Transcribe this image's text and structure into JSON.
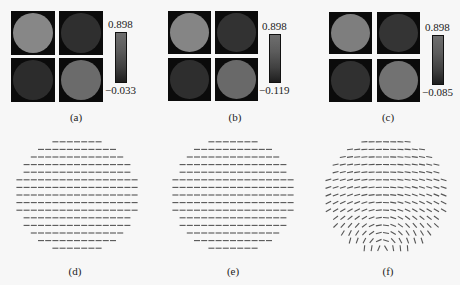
{
  "figure": {
    "panels_top": [
      {
        "id": "a",
        "caption": "(a)",
        "caption_pos": [
          76,
          111
        ],
        "colorbar": {
          "max_label": "0.898",
          "min_label": "−0.033",
          "x": 115,
          "y": 32,
          "h": 51
        },
        "squares": [
          {
            "x": 11,
            "y": 11,
            "w": 44,
            "h": 44,
            "fill": "#878787"
          },
          {
            "x": 59,
            "y": 11,
            "w": 44,
            "h": 44,
            "fill": "#2f2f2f"
          },
          {
            "x": 11,
            "y": 58,
            "w": 44,
            "h": 44,
            "fill": "#2c2c2c"
          },
          {
            "x": 59,
            "y": 58,
            "w": 44,
            "h": 44,
            "fill": "#6b6b6b"
          }
        ]
      },
      {
        "id": "b",
        "caption": "(b)",
        "caption_pos": [
          235,
          111
        ],
        "colorbar": {
          "max_label": "0.898",
          "min_label": "−0.119",
          "x": 269,
          "y": 34,
          "h": 49
        },
        "squares": [
          {
            "x": 168,
            "y": 11,
            "w": 43,
            "h": 43,
            "fill": "#858585"
          },
          {
            "x": 215,
            "y": 11,
            "w": 43,
            "h": 43,
            "fill": "#323232"
          },
          {
            "x": 168,
            "y": 58,
            "w": 43,
            "h": 43,
            "fill": "#2e2e2e"
          },
          {
            "x": 215,
            "y": 58,
            "w": 43,
            "h": 43,
            "fill": "#696969"
          }
        ]
      },
      {
        "id": "c",
        "caption": "(c)",
        "caption_pos": [
          388,
          111
        ],
        "colorbar": {
          "max_label": "0.898",
          "min_label": "−0.085",
          "x": 432,
          "y": 35,
          "h": 50
        },
        "squares": [
          {
            "x": 329,
            "y": 12,
            "w": 43,
            "h": 42,
            "fill": "#7e7e7e"
          },
          {
            "x": 377,
            "y": 12,
            "w": 43,
            "h": 42,
            "fill": "#343434"
          },
          {
            "x": 329,
            "y": 59,
            "w": 43,
            "h": 43,
            "fill": "#303030"
          },
          {
            "x": 377,
            "y": 59,
            "w": 43,
            "h": 43,
            "fill": "#727272"
          }
        ]
      }
    ],
    "panels_bottom": [
      {
        "id": "d",
        "caption": "(d)",
        "caption_pos": [
          75,
          265
        ],
        "field": {
          "cx": 77,
          "cy": 195,
          "r": 60,
          "dx": 7.2,
          "dy": 7.6,
          "type": "uniform",
          "color": "#555"
        }
      },
      {
        "id": "e",
        "caption": "(e)",
        "caption_pos": [
          233,
          265
        ],
        "field": {
          "cx": 233,
          "cy": 195,
          "r": 60,
          "dx": 7.2,
          "dy": 7.6,
          "type": "uniform",
          "color": "#555"
        }
      },
      {
        "id": "f",
        "caption": "(f)",
        "caption_pos": [
          388,
          265
        ],
        "field": {
          "cx": 386,
          "cy": 195,
          "r": 60,
          "dx": 7.2,
          "dy": 7.6,
          "type": "vortex",
          "vx": 383,
          "vy": 250,
          "color": "#555"
        }
      }
    ]
  }
}
